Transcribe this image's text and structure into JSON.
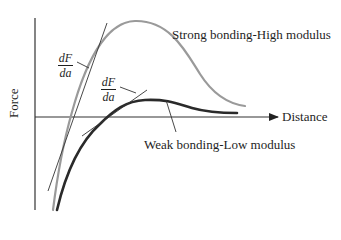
{
  "figure": {
    "y_axis_label": "Force",
    "x_axis_label": "Distance",
    "curves": [
      {
        "name": "strong",
        "label": "Strong bonding-High modulus",
        "color": "#9a9a9a",
        "stroke_width": 2.2
      },
      {
        "name": "weak",
        "label": "Weak bonding-Low modulus",
        "color": "#2a2a2a",
        "stroke_width": 2.6
      }
    ],
    "tangent_annotations": [
      {
        "numerator": "dF",
        "denominator": "da",
        "target": "strong"
      },
      {
        "numerator": "dF",
        "denominator": "da",
        "target": "weak"
      }
    ],
    "axis_color": "#333333",
    "tangent_color": "#333333"
  }
}
